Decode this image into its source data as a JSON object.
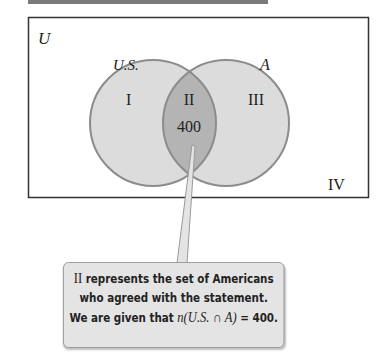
{
  "diagram": {
    "type": "venn",
    "universe_label": "U",
    "sets": [
      {
        "name": "U.S.",
        "label": "U.S."
      },
      {
        "name": "A",
        "label": "A"
      }
    ],
    "regions": [
      {
        "id": "I",
        "label": "I"
      },
      {
        "id": "II",
        "label": "II",
        "value": "400"
      },
      {
        "id": "III",
        "label": "III"
      },
      {
        "id": "IV",
        "label": "IV"
      }
    ],
    "colors": {
      "circle_fill": "#dcdcdc",
      "circle_stroke": "#8c8c8c",
      "intersection_fill": "#b4b4b4",
      "callout_bg": "#e4e4e4",
      "border": "#333333"
    }
  },
  "callout": {
    "line1_roman": "II",
    "line1_rest": " represents the set of Americans",
    "line2": "who agreed with the statement.",
    "line3_prefix": "We are given that ",
    "line3_math": "n(U.S. ∩ A)",
    "line3_suffix": " = 400."
  }
}
